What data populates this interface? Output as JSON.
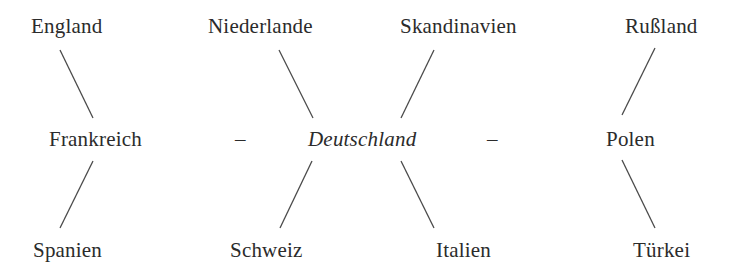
{
  "diagram": {
    "center": "Deutschland",
    "top_row": [
      "England",
      "Niederlande",
      "Skandinavien",
      "Rußland"
    ],
    "middle_row": {
      "left": "Frankreich",
      "dash_left": "–",
      "center": "Deutschland",
      "dash_right": "–",
      "right": "Polen"
    },
    "bottom_row": [
      "Spanien",
      "Schweiz",
      "Italien",
      "Türkei"
    ],
    "connections": [
      [
        "England",
        "Frankreich"
      ],
      [
        "Niederlande",
        "Deutschland"
      ],
      [
        "Skandinavien",
        "Deutschland"
      ],
      [
        "Rußland",
        "Polen"
      ],
      [
        "Frankreich",
        "Spanien"
      ],
      [
        "Deutschland",
        "Schweiz"
      ],
      [
        "Deutschland",
        "Italien"
      ],
      [
        "Polen",
        "Türkei"
      ],
      [
        "Frankreich",
        "Deutschland"
      ],
      [
        "Deutschland",
        "Polen"
      ]
    ]
  }
}
